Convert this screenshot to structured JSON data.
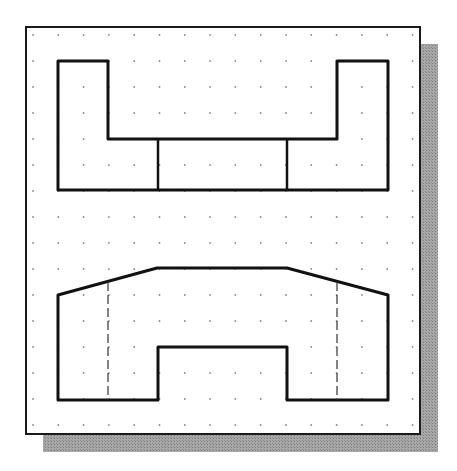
{
  "diagram": {
    "type": "orthographic-views",
    "sheet": {
      "x": 26,
      "y": 27,
      "width": 394,
      "height": 407,
      "border_color": "#1a1a1a",
      "fill": "#ffffff"
    },
    "shadow": {
      "offset_x": 17,
      "offset_y": 17,
      "color": "#9a9a9a"
    },
    "grid": {
      "origin_x": 33,
      "origin_y": 35,
      "spacing_x": 25.3,
      "spacing_y": 26.0,
      "cols": 16,
      "rows": 16,
      "dot_color": "#8a8a8a"
    },
    "views": [
      {
        "name": "top-view",
        "outline": [
          [
            58,
            61
          ],
          [
            108,
            61
          ],
          [
            108,
            139
          ],
          [
            337,
            139
          ],
          [
            337,
            61
          ],
          [
            388,
            61
          ],
          [
            388,
            190
          ],
          [
            58,
            190
          ]
        ],
        "visible_lines": [
          [
            [
              158,
              139
            ],
            [
              158,
              190
            ]
          ],
          [
            [
              287,
              139
            ],
            [
              287,
              190
            ]
          ]
        ],
        "hidden_lines": []
      },
      {
        "name": "front-view",
        "outline": [
          [
            58,
            295
          ],
          [
            157,
            268
          ],
          [
            287,
            268
          ],
          [
            388,
            295
          ],
          [
            388,
            400
          ],
          [
            287,
            400
          ],
          [
            287,
            347
          ],
          [
            158,
            347
          ],
          [
            158,
            400
          ],
          [
            58,
            400
          ]
        ],
        "visible_lines": [],
        "hidden_lines": [
          [
            [
              108,
              282
            ],
            [
              108,
              400
            ]
          ],
          [
            [
              337,
              282
            ],
            [
              337,
              400
            ]
          ]
        ]
      }
    ],
    "line_color": "#111111",
    "line_width": 3,
    "hidden_line_width": 1.2
  }
}
